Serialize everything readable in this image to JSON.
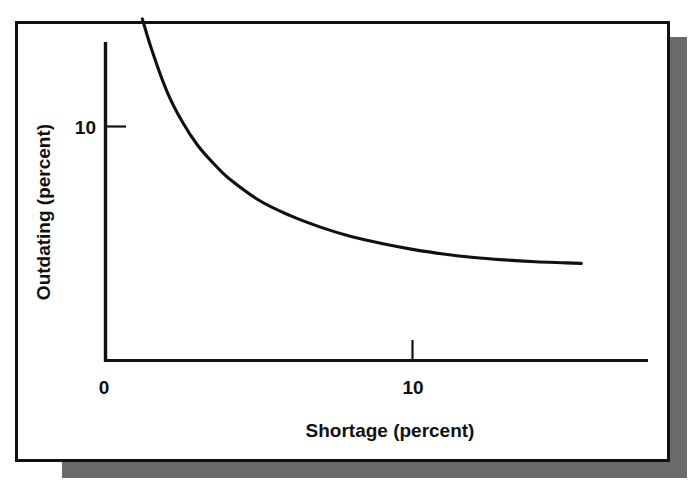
{
  "figure": {
    "frame_color": "#111111",
    "shadow_color": "#6a6a6a",
    "background": "#ffffff"
  },
  "chart_data": {
    "type": "line",
    "title": "",
    "subtitle": "",
    "xlabel": "Shortage (percent)",
    "ylabel": "Outdating (percent)",
    "xlim": [
      0,
      17.5
    ],
    "ylim": [
      0,
      16.5
    ],
    "xticks": [
      0,
      10
    ],
    "xticklabels": [
      "0",
      "10"
    ],
    "yticks": [
      10
    ],
    "yticklabels": [
      "10"
    ],
    "grid": false,
    "legend": null,
    "line_color": "#111111",
    "series": [
      {
        "name": "outdating-vs-shortage",
        "x": [
          1.2,
          1.5,
          2.0,
          2.5,
          3.0,
          3.5,
          4.0,
          5.0,
          6.0,
          7.0,
          8.0,
          9.0,
          10.0,
          11.0,
          12.0,
          13.0,
          14.0,
          15.0,
          15.5
        ],
        "y": [
          14.6,
          13.3,
          11.5,
          10.2,
          9.2,
          8.45,
          7.8,
          6.85,
          6.2,
          5.7,
          5.3,
          5.0,
          4.75,
          4.55,
          4.4,
          4.3,
          4.22,
          4.17,
          4.15
        ]
      }
    ],
    "annotations": []
  },
  "labels": {
    "y_axis": "Outdating (percent)",
    "x_axis": "Shortage (percent)",
    "y_tick_10": "10",
    "x_tick_0": "0",
    "x_tick_10": "10"
  }
}
